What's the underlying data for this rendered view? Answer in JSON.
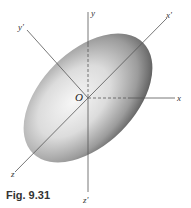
{
  "figure": {
    "caption": "Fig. 9.31",
    "origin_label": "O",
    "axes": {
      "x": "x",
      "y": "y",
      "z": "z",
      "x_prime": "x'",
      "y_prime": "y'",
      "z_prime": "z'"
    },
    "shape": "ellipsoid",
    "colors": {
      "axis": "#555555",
      "shade_dark": "#6b6b6b",
      "shade_light": "#f4f4f4"
    }
  }
}
